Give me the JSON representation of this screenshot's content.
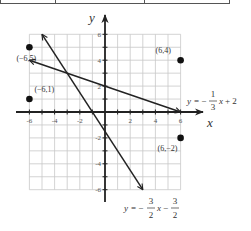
{
  "chart_data": {
    "type": "line",
    "title": "",
    "xlabel": "x",
    "ylabel": "y",
    "xlim": [
      -6,
      6
    ],
    "ylim": [
      -6,
      6
    ],
    "grid": true,
    "x_ticks": [
      "-6",
      "-4",
      "-2",
      "2",
      "4",
      "6"
    ],
    "y_ticks": [
      "6",
      "4",
      "2",
      "-2",
      "-4",
      "-6"
    ],
    "series": [
      {
        "name": "y = -1/3 x + 2",
        "equation": {
          "lhs": "y",
          "sign": "=",
          "neg": "−",
          "num": "1",
          "den": "3",
          "var": "x",
          "rest": "+ 2"
        },
        "x": [
          -6,
          6
        ],
        "y": [
          4,
          0
        ],
        "arrows": "both"
      },
      {
        "name": "y = -3/2 x - 3/2",
        "equation": {
          "lhs": "y",
          "sign": "=",
          "neg": "−",
          "num": "3",
          "den": "2",
          "var": "x",
          "op": "−",
          "num2": "3",
          "den2": "2"
        },
        "x": [
          -5,
          3
        ],
        "y": [
          6,
          -6
        ],
        "arrows": "both"
      }
    ],
    "points": [
      {
        "x": -6,
        "y": 5,
        "label": "(−6,5)"
      },
      {
        "x": -6,
        "y": 1,
        "label": "(−6,1)"
      },
      {
        "x": 6,
        "y": 4,
        "label": "(6,4)"
      },
      {
        "x": 6,
        "y": -2,
        "label": "(6,−2)"
      }
    ],
    "intersection": {
      "x": -3,
      "y": 3
    }
  }
}
